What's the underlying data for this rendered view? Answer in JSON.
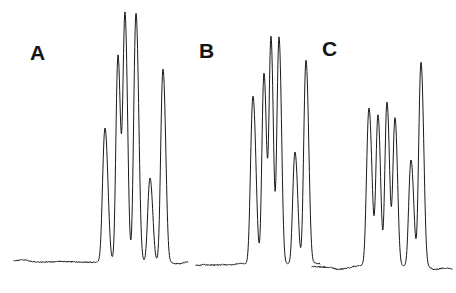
{
  "figure": {
    "width": 456,
    "height": 293,
    "background_color": "#ffffff",
    "trace_color": "#1a1a1a",
    "trace_width": 1.0,
    "kind": "three-panel chromatogram trace figure"
  },
  "panels": [
    {
      "id": "A",
      "label": "A",
      "label_x": 30,
      "label_y": 42
    },
    {
      "id": "B",
      "label": "B",
      "label_x": 199,
      "label_y": 40
    },
    {
      "id": "C",
      "label": "C",
      "label_x": 322,
      "label_y": 38
    }
  ],
  "chart_data": {
    "type": "line",
    "title": "",
    "subtitle": "",
    "xlabel": "",
    "ylabel": "",
    "xlim": [
      0,
      456
    ],
    "ylim": [
      293,
      0
    ],
    "grid": false,
    "legend": "none",
    "axes_visible": false,
    "tick_labels_x": [],
    "tick_labels_y": [],
    "annotations": [
      "A",
      "B",
      "C"
    ],
    "note": "Pixel coordinates; y increases downward. Baseline of every panel sits near y=262. Peak tips given as [x, y_top].",
    "series": [
      {
        "name": "A",
        "label": "A",
        "baseline_y": 262,
        "x_start": 14,
        "x_end": 188,
        "baseline_noise_amplitude": 5,
        "peaks": [
          {
            "x": 105,
            "top_y": 128,
            "half_width": 3.0,
            "height": 134
          },
          {
            "x": 118,
            "top_y": 55,
            "half_width": 2.6,
            "height": 207
          },
          {
            "x": 125,
            "top_y": 14,
            "half_width": 2.6,
            "height": 248
          },
          {
            "x": 136,
            "top_y": 13,
            "half_width": 2.8,
            "height": 249
          },
          {
            "x": 150,
            "top_y": 178,
            "half_width": 2.8,
            "height": 84
          },
          {
            "x": 163,
            "top_y": 69,
            "half_width": 2.8,
            "height": 193
          }
        ]
      },
      {
        "name": "B",
        "label": "B",
        "baseline_y": 264,
        "x_start": 196,
        "x_end": 320,
        "baseline_noise_amplitude": 5,
        "peaks": [
          {
            "x": 253,
            "top_y": 96,
            "half_width": 3.0,
            "height": 168
          },
          {
            "x": 264,
            "top_y": 73,
            "half_width": 2.6,
            "height": 191
          },
          {
            "x": 271,
            "top_y": 38,
            "half_width": 2.4,
            "height": 226
          },
          {
            "x": 279,
            "top_y": 37,
            "half_width": 2.6,
            "height": 227
          },
          {
            "x": 295,
            "top_y": 152,
            "half_width": 2.8,
            "height": 112
          },
          {
            "x": 306,
            "top_y": 60,
            "half_width": 2.8,
            "height": 204
          }
        ]
      },
      {
        "name": "C",
        "label": "C",
        "baseline_y": 266,
        "x_start": 312,
        "x_end": 452,
        "baseline_noise_amplitude": 6,
        "peaks": [
          {
            "x": 369,
            "top_y": 108,
            "half_width": 3.0,
            "height": 158
          },
          {
            "x": 378,
            "top_y": 115,
            "half_width": 2.6,
            "height": 151
          },
          {
            "x": 387,
            "top_y": 102,
            "half_width": 2.6,
            "height": 164
          },
          {
            "x": 395,
            "top_y": 118,
            "half_width": 2.6,
            "height": 148
          },
          {
            "x": 411,
            "top_y": 160,
            "half_width": 2.8,
            "height": 106
          },
          {
            "x": 421,
            "top_y": 62,
            "half_width": 2.8,
            "height": 204
          }
        ]
      }
    ]
  }
}
